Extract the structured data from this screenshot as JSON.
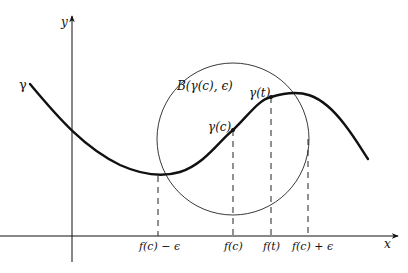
{
  "figure": {
    "axes": {
      "x_label": "x",
      "y_label": "y"
    },
    "curve": {
      "label": "γ"
    },
    "ball": {
      "label": "B(γ(c), ϵ)"
    },
    "points": [
      {
        "name": "gamma-c",
        "label": "γ(c)"
      },
      {
        "name": "gamma-t",
        "label": "γ(t)"
      }
    ],
    "x_ticks": [
      {
        "label": "f(c) − ϵ"
      },
      {
        "label": "f(c)"
      },
      {
        "label": "f(t)"
      },
      {
        "label": "f(c) + ϵ"
      }
    ],
    "colors": {
      "ink": "#111111",
      "background": "#ffffff"
    }
  }
}
